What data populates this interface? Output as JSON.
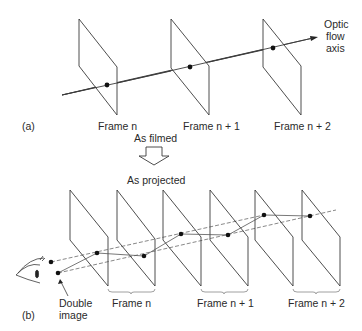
{
  "panel_a": {
    "tag": "(a)",
    "frames": [
      "Frame n",
      "Frame n + 1",
      "Frame n + 2"
    ],
    "axis_label": [
      "Optic",
      "flow",
      "axis"
    ]
  },
  "transition": {
    "top": "As filmed",
    "bottom": "As projected"
  },
  "panel_b": {
    "tag": "(b)",
    "frame_groups": [
      "Frame n",
      "Frame n + 1",
      "Frame n + 2"
    ],
    "double_image": [
      "Double",
      "image"
    ]
  },
  "colors": {
    "line": "#3a3a3a",
    "text": "#2a2a2a",
    "dot": "#111111"
  }
}
